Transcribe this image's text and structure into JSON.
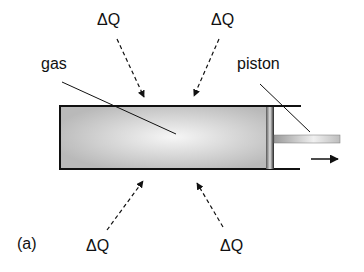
{
  "diagram": {
    "panel_label": "(a)",
    "labels": {
      "gas": "gas",
      "piston": "piston"
    },
    "heat_labels": {
      "top_left": "ΔQ",
      "top_right": "ΔQ",
      "bottom_left": "ΔQ",
      "bottom_right": "ΔQ"
    },
    "colors": {
      "outline": "#111111",
      "gas_fill_edge": "#b8b8b8",
      "gas_fill_center": "#f4f4f4",
      "piston_dark": "#333333"
    }
  }
}
